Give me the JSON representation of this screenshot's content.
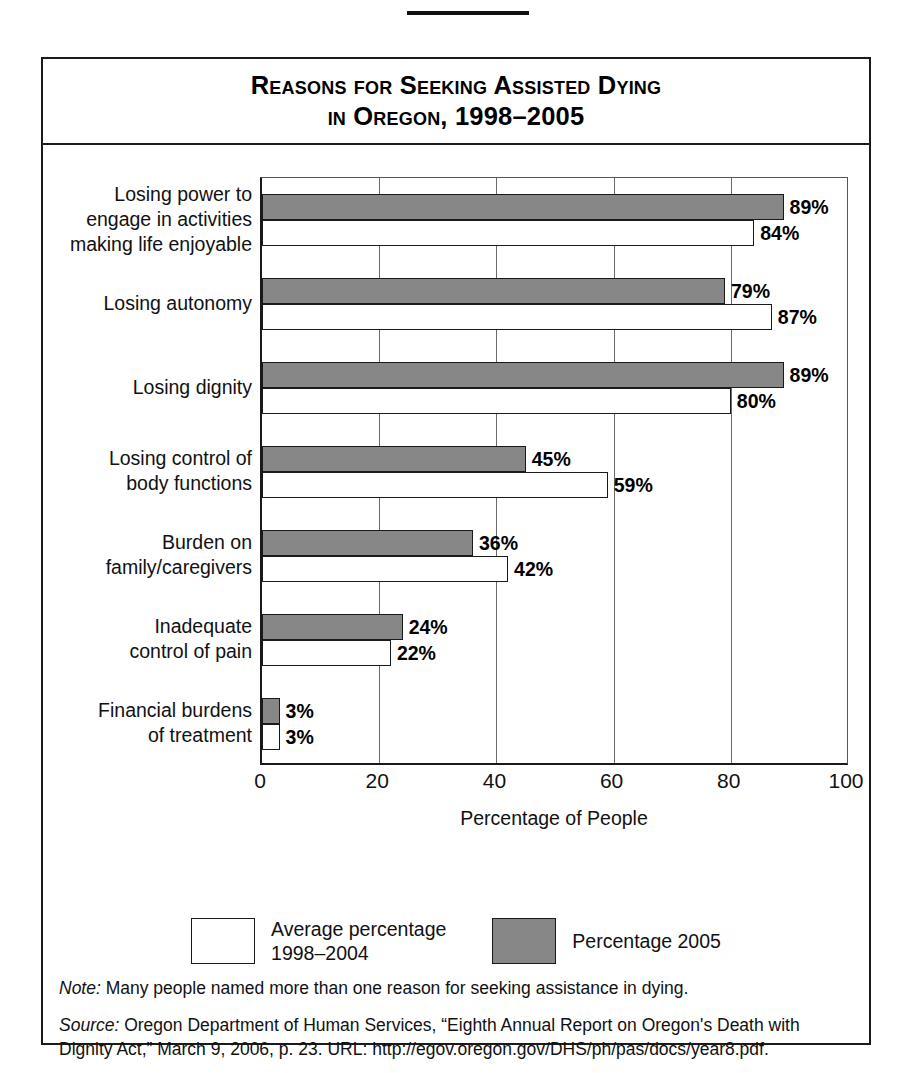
{
  "figure": {
    "title_line_1": "Reasons for Seeking Assisted Dying",
    "title_line_2": "in Oregon, 1998–2005",
    "note_lead": "Note:",
    "note_text": " Many people named more than one reason for seeking assistance in dying.",
    "source_lead": "Source:",
    "source_text": " Oregon Department of Human Services, “Eighth Annual Report on Oregon's Death with Dignity Act,” March 9, 2006, p. 23. URL: http://egov.oregon.gov/DHS/ph/pas/docs/year8.pdf.",
    "credit": "© Infobase Publishing"
  },
  "colors": {
    "dark_bar": "#878787",
    "light_bar": "#ffffff",
    "outline": "#1a1a1a",
    "gridline": "#6a6a6a"
  },
  "legend": {
    "items": [
      {
        "swatch": "light",
        "line1": "Average percentage",
        "line2": "1998–2004"
      },
      {
        "swatch": "dark",
        "line1": "Percentage 2005",
        "line2": ""
      }
    ]
  },
  "chart_data": {
    "type": "bar",
    "orientation": "horizontal",
    "title": "Reasons for Seeking Assisted Dying in Oregon, 1998–2005",
    "xlabel": "Percentage of People",
    "ylabel": "",
    "xlim": [
      0,
      100
    ],
    "xticks": [
      0,
      20,
      40,
      60,
      80,
      100
    ],
    "xtick_labels": [
      "0",
      "20",
      "40",
      "60",
      "80",
      "100"
    ],
    "grid": true,
    "grid_axis": "x",
    "legend_position": "bottom",
    "value_suffix": "%",
    "categories": [
      "Losing power to engage in activities making life enjoyable",
      "Losing autonomy",
      "Losing dignity",
      "Losing control of body functions",
      "Burden on family/caregivers",
      "Inadequate control of pain",
      "Financial burdens of treatment"
    ],
    "category_label_lines": [
      [
        "Losing power to",
        "engage in activities",
        "making life enjoyable"
      ],
      [
        "Losing autonomy"
      ],
      [
        "Losing dignity"
      ],
      [
        "Losing control of",
        "body functions"
      ],
      [
        "Burden on",
        "family/caregivers"
      ],
      [
        "Inadequate",
        "control of pain"
      ],
      [
        "Financial burdens",
        "of treatment"
      ]
    ],
    "series": [
      {
        "name": "Percentage 2005",
        "style": "dark",
        "values": [
          89,
          79,
          89,
          45,
          36,
          24,
          3
        ],
        "labels": [
          "89%",
          "79%",
          "89%",
          "45%",
          "36%",
          "24%",
          "3%"
        ]
      },
      {
        "name": "Average percentage 1998–2004",
        "style": "light",
        "values": [
          84,
          87,
          80,
          59,
          42,
          22,
          3
        ],
        "labels": [
          "84%",
          "87%",
          "80%",
          "59%",
          "42%",
          "22%",
          "3%"
        ]
      }
    ]
  }
}
